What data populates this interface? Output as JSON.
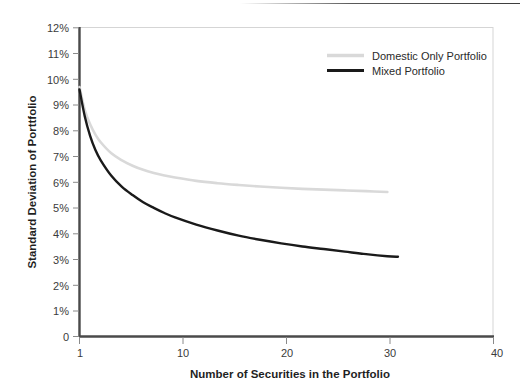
{
  "chart_data": {
    "type": "line",
    "title": "",
    "xlabel": "Number of Securities in the Portfolio",
    "ylabel": "Standard Deviation of Porttfolio",
    "xlim": [
      1,
      40
    ],
    "ylim": [
      0,
      12
    ],
    "xticks": [
      1,
      10,
      20,
      30,
      40
    ],
    "xtick_labels": [
      "1",
      "10",
      "20",
      "30",
      "40"
    ],
    "yticks": [
      0,
      1,
      2,
      3,
      4,
      5,
      6,
      7,
      8,
      9,
      10,
      11,
      12
    ],
    "ytick_labels": [
      "0",
      "1%",
      "2%",
      "3%",
      "4%",
      "5%",
      "6%",
      "7%",
      "8%",
      "9%",
      "10%",
      "11%",
      "12%"
    ],
    "grid": false,
    "legend_position": "top-right",
    "series": [
      {
        "name": "Domestic Only Portfolio",
        "color": "#d9d9d9",
        "x": [
          1,
          1.5,
          2,
          2.5,
          3,
          4,
          5,
          6,
          7,
          8,
          9,
          10,
          12,
          14,
          16,
          18,
          20,
          22,
          24,
          26,
          28,
          30
        ],
        "values": [
          9.7,
          8.8,
          8.25,
          7.85,
          7.55,
          7.12,
          6.85,
          6.64,
          6.48,
          6.36,
          6.26,
          6.18,
          6.05,
          5.96,
          5.89,
          5.83,
          5.78,
          5.74,
          5.71,
          5.68,
          5.65,
          5.62
        ]
      },
      {
        "name": "Mixed Portfolio",
        "color": "#1a1a1a",
        "x": [
          1,
          1.5,
          2,
          2.5,
          3,
          4,
          5,
          6,
          7,
          8,
          9,
          10,
          12,
          14,
          16,
          18,
          20,
          22,
          24,
          26,
          28,
          30,
          31
        ],
        "values": [
          9.6,
          8.55,
          7.8,
          7.25,
          6.85,
          6.25,
          5.82,
          5.5,
          5.22,
          5.0,
          4.8,
          4.63,
          4.35,
          4.12,
          3.92,
          3.76,
          3.62,
          3.5,
          3.4,
          3.3,
          3.2,
          3.12,
          3.1
        ]
      }
    ]
  },
  "legend": {
    "items": [
      {
        "label": "Domestic Only Portfolio",
        "color": "#d9d9d9"
      },
      {
        "label": "Mixed Portfolio",
        "color": "#1a1a1a"
      }
    ]
  },
  "axes": {
    "y_title": "Standard Deviation of Porttfolio",
    "x_title": "Number of Securities in the Portfolio",
    "y_labels": [
      "12%",
      "11%",
      "10%",
      "9%",
      "8%",
      "7%",
      "6%",
      "5%",
      "4%",
      "3%",
      "2%",
      "1%",
      "0"
    ],
    "x_labels": [
      "1",
      "10",
      "20",
      "30",
      "40"
    ]
  }
}
